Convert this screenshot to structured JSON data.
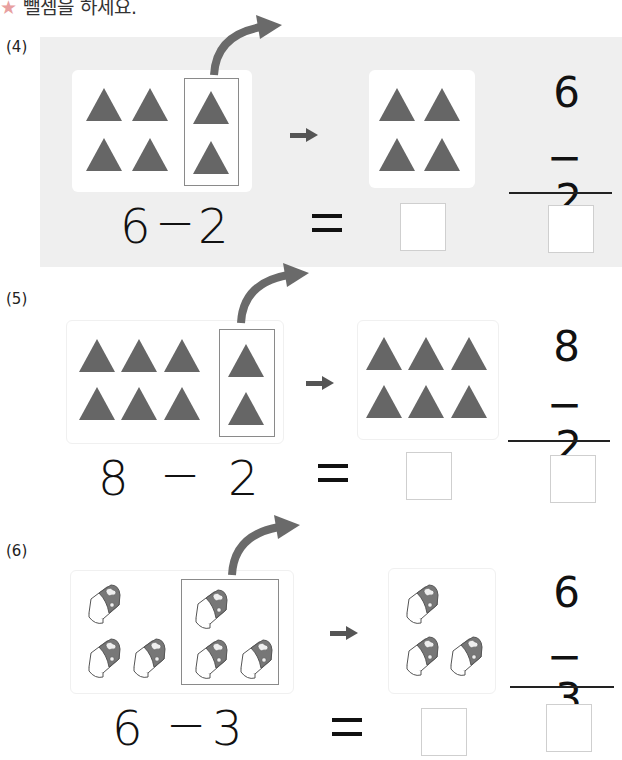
{
  "header": {
    "star_icon": "star-icon",
    "instruction": "뺄셈을 하세요."
  },
  "problems": [
    {
      "label": "(4)",
      "item": "triangle",
      "total": 6,
      "removed": 2,
      "remaining": 4,
      "horizontal": {
        "minuend": "6",
        "operator": "−",
        "subtrahend": "2",
        "equals": "="
      },
      "vertical": {
        "top": "6",
        "bottom": "− 2"
      },
      "answer_horizontal": "",
      "answer_vertical": ""
    },
    {
      "label": "(5)",
      "item": "triangle",
      "total": 8,
      "removed": 2,
      "remaining": 6,
      "horizontal": {
        "minuend": "8",
        "operator": "−",
        "subtrahend": "2",
        "equals": "="
      },
      "vertical": {
        "top": "8",
        "bottom": "− 2"
      },
      "answer_horizontal": "",
      "answer_vertical": ""
    },
    {
      "label": "(6)",
      "item": "eraser",
      "total": 6,
      "removed": 3,
      "remaining": 3,
      "horizontal": {
        "minuend": "6",
        "operator": "−",
        "subtrahend": "3",
        "equals": "="
      },
      "vertical": {
        "top": "6",
        "bottom": "− 3"
      },
      "answer_horizontal": "",
      "answer_vertical": ""
    }
  ],
  "colors": {
    "shape_fill": "#666666",
    "panel_bg": "#efefef",
    "group_border": "#8a8a8a",
    "answer_box_border": "#cfcfcf"
  }
}
